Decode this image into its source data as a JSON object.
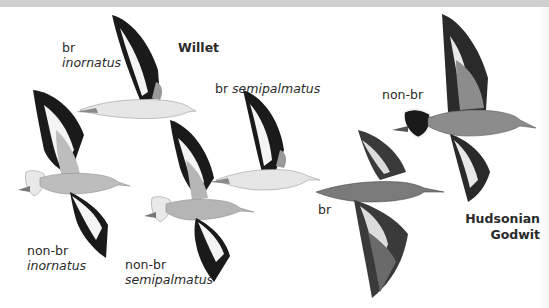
{
  "plate": {
    "species": [
      {
        "name": "Willet"
      },
      {
        "name_line1": "Hudsonian",
        "name_line2": "Godwit"
      }
    ],
    "labels": {
      "willet_br_inornatus": {
        "plumage": "br",
        "subspecies": "inornatus"
      },
      "willet_br_semipalmatus": {
        "plumage": "br",
        "subspecies": "semipalmatus"
      },
      "willet_nonbr_inornatus": {
        "plumage": "non-br",
        "subspecies": "inornatus"
      },
      "willet_nonbr_semipalmatus": {
        "plumage": "non-br",
        "subspecies": "semipalmatus"
      },
      "godwit_nonbr": {
        "plumage": "non-br"
      },
      "godwit_br": {
        "plumage": "br"
      }
    },
    "colors": {
      "band": "#cfcfcf",
      "wing_black": "#1a1a1a",
      "wing_white": "#f4f4f4",
      "willet_gray": "#b9b9b9",
      "godwit_gray": "#8c8c8c",
      "godwit_br_body": "#7a7a7a",
      "text": "#2a2a2a"
    }
  }
}
